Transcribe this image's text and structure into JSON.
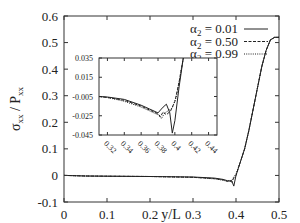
{
  "chart_data": {
    "type": "line",
    "title": "",
    "xlabel": "y/L",
    "ylabel": "σxx / Pxx",
    "ylabel_main": "σ",
    "ylabel_sub1": "xx",
    "ylabel_mid": " / P",
    "ylabel_sub2": "xx",
    "xlim": [
      0,
      0.5
    ],
    "ylim": [
      -0.1,
      0.6
    ],
    "xticks": [
      "0",
      "0.1",
      "0.2",
      "0.3",
      "0.4",
      "0.5"
    ],
    "yticks": [
      "-0.1",
      "0",
      "0.1",
      "0.2",
      "0.3",
      "0.4",
      "0.5",
      "0.6"
    ],
    "grid": false,
    "legend_position": "top-right",
    "legend": [
      {
        "name": "α2 = 0.01",
        "greek": "α",
        "sub": "2",
        "value": " = 0.01",
        "style": "solid"
      },
      {
        "name": "α2 = 0.50",
        "greek": "α",
        "sub": "2",
        "value": " = 0.50",
        "style": "dashed"
      },
      {
        "name": "α2 = 0.99",
        "greek": "α",
        "sub": "2",
        "value": " = 0.99",
        "style": "dotted"
      }
    ],
    "series": [
      {
        "name": "α2 = 0.01",
        "style": "solid",
        "x": [
          0,
          0.05,
          0.1,
          0.2,
          0.3,
          0.35,
          0.37,
          0.38,
          0.385,
          0.39,
          0.395,
          0.4,
          0.41,
          0.42,
          0.43,
          0.44,
          0.45,
          0.46,
          0.47,
          0.48,
          0.49,
          0.5
        ],
        "y": [
          0.0,
          -0.002,
          -0.003,
          -0.004,
          -0.006,
          -0.01,
          -0.015,
          -0.02,
          -0.02,
          -0.02,
          -0.04,
          0.0,
          0.05,
          0.1,
          0.17,
          0.25,
          0.33,
          0.41,
          0.47,
          0.51,
          0.52,
          0.52
        ]
      },
      {
        "name": "α2 = 0.50",
        "style": "dashed",
        "x": [
          0,
          0.05,
          0.1,
          0.2,
          0.3,
          0.35,
          0.37,
          0.38,
          0.385,
          0.39,
          0.395,
          0.4,
          0.41,
          0.42,
          0.43,
          0.44,
          0.45,
          0.46,
          0.47,
          0.48,
          0.49,
          0.5
        ],
        "y": [
          0.0,
          -0.002,
          -0.003,
          -0.004,
          -0.007,
          -0.012,
          -0.017,
          -0.022,
          -0.02,
          -0.025,
          -0.01,
          0.0,
          0.05,
          0.1,
          0.17,
          0.25,
          0.33,
          0.41,
          0.47,
          0.51,
          0.52,
          0.52
        ]
      },
      {
        "name": "α2 = 0.99",
        "style": "dotted",
        "x": [
          0,
          0.05,
          0.1,
          0.2,
          0.3,
          0.35,
          0.37,
          0.38,
          0.385,
          0.39,
          0.395,
          0.4,
          0.41,
          0.42,
          0.43,
          0.44,
          0.45,
          0.46,
          0.47,
          0.48,
          0.49,
          0.5
        ],
        "y": [
          0.0,
          -0.002,
          -0.003,
          -0.004,
          -0.007,
          -0.013,
          -0.018,
          -0.023,
          -0.022,
          -0.02,
          -0.005,
          0.005,
          0.05,
          0.1,
          0.17,
          0.25,
          0.33,
          0.41,
          0.47,
          0.51,
          0.52,
          0.52
        ]
      }
    ],
    "inset": {
      "type": "line",
      "xlim": [
        0.31,
        0.45
      ],
      "ylim": [
        -0.045,
        0.035
      ],
      "xticks": [
        "0.32",
        "0.34",
        "0.36",
        "0.38",
        "0.4",
        "0.42",
        "0.44"
      ],
      "yticks": [
        "0.035",
        "0.015",
        "-0.005",
        "-0.025",
        "-0.045"
      ],
      "xtick_rotation": -45,
      "series": [
        {
          "name": "α2 = 0.01",
          "style": "solid",
          "x": [
            0.31,
            0.32,
            0.34,
            0.36,
            0.37,
            0.38,
            0.383,
            0.386,
            0.39,
            0.394,
            0.397,
            0.4,
            0.405,
            0.41
          ],
          "y": [
            -0.005,
            -0.0055,
            -0.008,
            -0.014,
            -0.018,
            -0.022,
            -0.019,
            -0.016,
            -0.013,
            -0.022,
            -0.043,
            -0.03,
            0.005,
            0.035
          ]
        },
        {
          "name": "α2 = 0.50",
          "style": "dashed",
          "x": [
            0.31,
            0.32,
            0.34,
            0.36,
            0.37,
            0.38,
            0.383,
            0.386,
            0.39,
            0.395,
            0.4,
            0.405,
            0.41
          ],
          "y": [
            -0.005,
            -0.006,
            -0.009,
            -0.015,
            -0.019,
            -0.023,
            -0.026,
            -0.021,
            -0.024,
            -0.02,
            -0.01,
            0.01,
            0.035
          ]
        },
        {
          "name": "α2 = 0.99",
          "style": "dotted",
          "x": [
            0.31,
            0.32,
            0.34,
            0.36,
            0.37,
            0.38,
            0.384,
            0.388,
            0.392,
            0.397,
            0.402,
            0.41
          ],
          "y": [
            -0.005,
            -0.006,
            -0.01,
            -0.016,
            -0.02,
            -0.024,
            -0.028,
            -0.022,
            -0.02,
            -0.017,
            -0.005,
            0.035
          ]
        }
      ]
    }
  }
}
